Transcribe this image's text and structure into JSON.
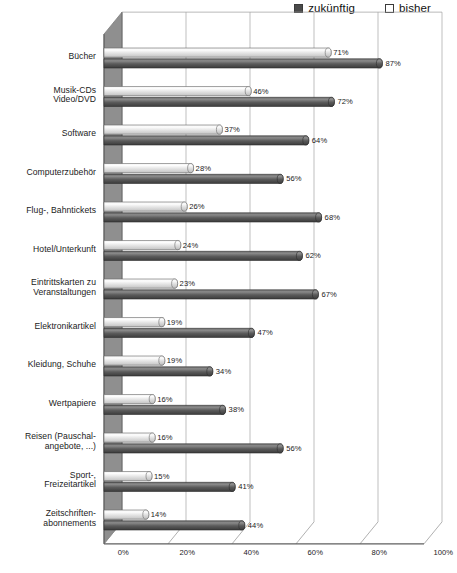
{
  "legend": {
    "items": [
      {
        "label": "zukünftig",
        "icon": "filled-square-icon",
        "color": "#4a4a4a"
      },
      {
        "label": "bisher",
        "icon": "empty-square-icon",
        "color": "#ffffff"
      }
    ]
  },
  "axis": {
    "ticks": [
      "0%",
      "20%",
      "40%",
      "60%",
      "80%",
      "100%"
    ],
    "tick_values": [
      0,
      20,
      40,
      60,
      80,
      100
    ]
  },
  "colors": {
    "series_zukuenftig": "#595959",
    "series_bisher": "#e8e8e8",
    "gridline": "#9a9a9a",
    "wall": "#8c8c8c",
    "text": "#1b1b1b"
  },
  "chart_data": {
    "type": "bar",
    "orientation": "horizontal",
    "title": "",
    "xlabel": "",
    "ylabel": "",
    "xlim": [
      0,
      100
    ],
    "grid": true,
    "legend_position": "top-right",
    "categories": [
      "Bücher",
      "Musik-CDs Video/DVD",
      "Software",
      "Computerzubehör",
      "Flug-, Bahntickets",
      "Hotel/Unterkunft",
      "Eintrittskarten zu Veranstaltungen",
      "Elektronikartikel",
      "Kleidung, Schuhe",
      "Wertpapiere",
      "Reisen (Pauschalangebote, ...)",
      "Sport-, Freizeitartikel",
      "Zeitschriftenabonnements"
    ],
    "category_lines": [
      [
        "Bücher"
      ],
      [
        "Musik-CDs",
        "Video/DVD"
      ],
      [
        "Software"
      ],
      [
        "Computerzubehör"
      ],
      [
        "Flug-, Bahntickets"
      ],
      [
        "Hotel/Unterkunft"
      ],
      [
        "Eintrittskarten zu",
        "Veranstaltungen"
      ],
      [
        "Elektronikartikel"
      ],
      [
        "Kleidung, Schuhe"
      ],
      [
        "Wertpapiere"
      ],
      [
        "Reisen (Pauschal-",
        "angebote, ...)"
      ],
      [
        "Sport-,",
        "Freizeitartikel"
      ],
      [
        "Zeitschriften-",
        "abonnements"
      ]
    ],
    "series": [
      {
        "name": "bisher",
        "values": [
          71,
          46,
          37,
          28,
          26,
          24,
          23,
          19,
          19,
          16,
          16,
          15,
          14
        ],
        "labels": [
          "71%",
          "46%",
          "37%",
          "28%",
          "26%",
          "24%",
          "23%",
          "19%",
          "19%",
          "16%",
          "16%",
          "15%",
          "14%"
        ]
      },
      {
        "name": "zukünftig",
        "values": [
          87,
          72,
          64,
          56,
          68,
          62,
          67,
          47,
          34,
          38,
          56,
          41,
          44
        ],
        "labels": [
          "87%",
          "72%",
          "64%",
          "56%",
          "68%",
          "62%",
          "67%",
          "47%",
          "34%",
          "38%",
          "56%",
          "41%",
          "44%"
        ]
      }
    ]
  }
}
